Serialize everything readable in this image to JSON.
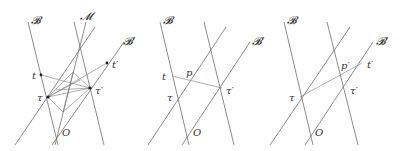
{
  "figure": {
    "panels": [
      {
        "id": "panel-1",
        "labels": {
          "B": "𝓑",
          "M": "𝓜",
          "Bprime": "𝓑′",
          "t": "t",
          "tprime": "t′",
          "tau": "τ",
          "tauprime": "τ′",
          "O": "O"
        }
      },
      {
        "id": "panel-2",
        "labels": {
          "B": "𝓑",
          "Bprime": "𝓑′",
          "t": "t",
          "p": "p",
          "tau": "τ",
          "tauprime": "τ′",
          "O": "O"
        }
      },
      {
        "id": "panel-3",
        "labels": {
          "B": "𝓑",
          "Bprime": "𝓑′",
          "pprime": "p′",
          "tprime": "t′",
          "tau": "τ",
          "tauprime": "τ′",
          "O": "O"
        }
      }
    ],
    "line_color": "#6e6e6e",
    "point_color": "#222222"
  }
}
